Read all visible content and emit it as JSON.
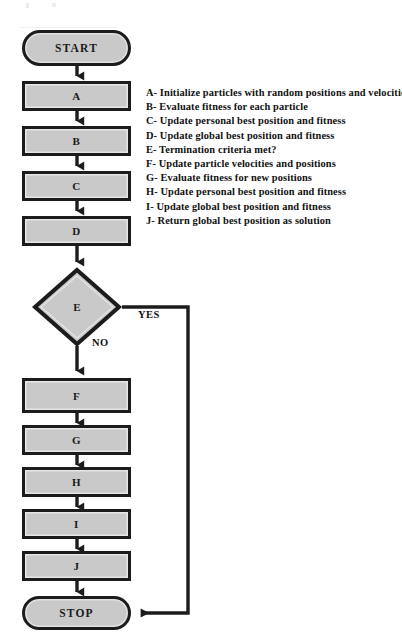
{
  "diagram": {
    "type": "flowchart",
    "colors": {
      "shape_fill": "#c9c9c9",
      "shape_stroke": "#1c1c1c",
      "text": "#111111",
      "background": "#ffffff"
    },
    "nodes": [
      {
        "id": "start",
        "label": "START",
        "shape": "terminator"
      },
      {
        "id": "a",
        "label": "A",
        "shape": "process"
      },
      {
        "id": "b",
        "label": "B",
        "shape": "process"
      },
      {
        "id": "c",
        "label": "C",
        "shape": "process"
      },
      {
        "id": "d",
        "label": "D",
        "shape": "process"
      },
      {
        "id": "e",
        "label": "E",
        "shape": "decision"
      },
      {
        "id": "f",
        "label": "F",
        "shape": "process"
      },
      {
        "id": "g",
        "label": "G",
        "shape": "process"
      },
      {
        "id": "h",
        "label": "H",
        "shape": "process"
      },
      {
        "id": "i",
        "label": "I",
        "shape": "process"
      },
      {
        "id": "j",
        "label": "J",
        "shape": "process"
      },
      {
        "id": "stop",
        "label": "STOP",
        "shape": "terminator"
      }
    ],
    "branch_labels": {
      "yes": "YES",
      "no": "NO"
    },
    "edges": [
      {
        "from": "start",
        "to": "a",
        "label": ""
      },
      {
        "from": "a",
        "to": "b",
        "label": ""
      },
      {
        "from": "b",
        "to": "c",
        "label": ""
      },
      {
        "from": "c",
        "to": "d",
        "label": ""
      },
      {
        "from": "d",
        "to": "e",
        "label": ""
      },
      {
        "from": "e",
        "to": "stop",
        "label": "YES"
      },
      {
        "from": "e",
        "to": "f",
        "label": "NO"
      },
      {
        "from": "f",
        "to": "g",
        "label": ""
      },
      {
        "from": "g",
        "to": "h",
        "label": ""
      },
      {
        "from": "h",
        "to": "i",
        "label": ""
      },
      {
        "from": "i",
        "to": "j",
        "label": ""
      },
      {
        "from": "j",
        "to": "stop",
        "label": ""
      }
    ]
  },
  "legend": {
    "entries": [
      "A- Initialize particles with random positions and velocities",
      "B- Evaluate fitness for each particle",
      "C- Update personal best position and fitness",
      "D- Update global best position and fitness",
      "E- Termination criteria met?",
      "F- Update particle velocities and positions",
      "G- Evaluate fitness for new positions",
      "H- Update personal best position and fitness",
      "I- Update global best position and fitness",
      "J- Return global best position as solution"
    ]
  }
}
